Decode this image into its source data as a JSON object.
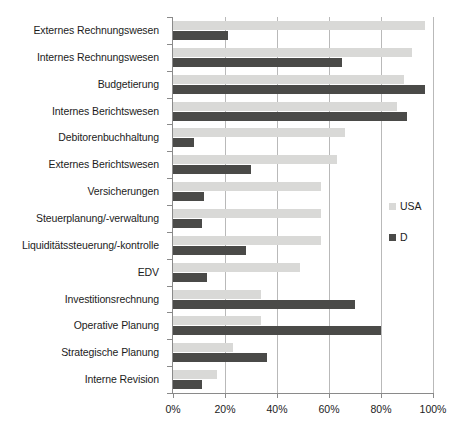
{
  "chart_data": {
    "type": "bar",
    "orientation": "horizontal",
    "title": "",
    "xlabel": "",
    "ylabel": "",
    "xlim": [
      0,
      100
    ],
    "xticks": [
      "0%",
      "20%",
      "40%",
      "60%",
      "80%",
      "100%"
    ],
    "xtick_values": [
      0,
      20,
      40,
      60,
      80,
      100
    ],
    "grid": true,
    "legend_position": "right",
    "categories": [
      "Externes Rechnungswesen",
      "Internes Rechnungswesen",
      "Budgetierung",
      "Internes Berichtswesen",
      "Debitorenbuchhaltung",
      "Externes Berichtswesen",
      "Versicherungen",
      "Steuerplanung/-verwaltung",
      "Liquiditätssteuerung/-kontrolle",
      "EDV",
      "Investitionsrechnung",
      "Operative Planung",
      "Strategische Planung",
      "Interne Revision"
    ],
    "series": [
      {
        "name": "USA",
        "color": "#d9d9d7",
        "values": [
          97,
          92,
          89,
          86,
          66,
          63,
          57,
          57,
          57,
          49,
          34,
          34,
          23,
          17
        ]
      },
      {
        "name": "D",
        "color": "#4a4a48",
        "values": [
          21,
          65,
          97,
          90,
          8,
          30,
          12,
          11,
          28,
          13,
          70,
          80,
          36,
          11
        ]
      }
    ]
  },
  "legend": {
    "items": [
      {
        "label": "USA",
        "swatch": "usa"
      },
      {
        "label": "D",
        "swatch": "d"
      }
    ]
  },
  "colors": {
    "usa_bar": "#d9d9d7",
    "d_bar": "#4a4a48",
    "axis": "#8a8a8a",
    "gridline": "#b9b9b9",
    "text": "#1c1c1c",
    "background": "#ffffff"
  }
}
